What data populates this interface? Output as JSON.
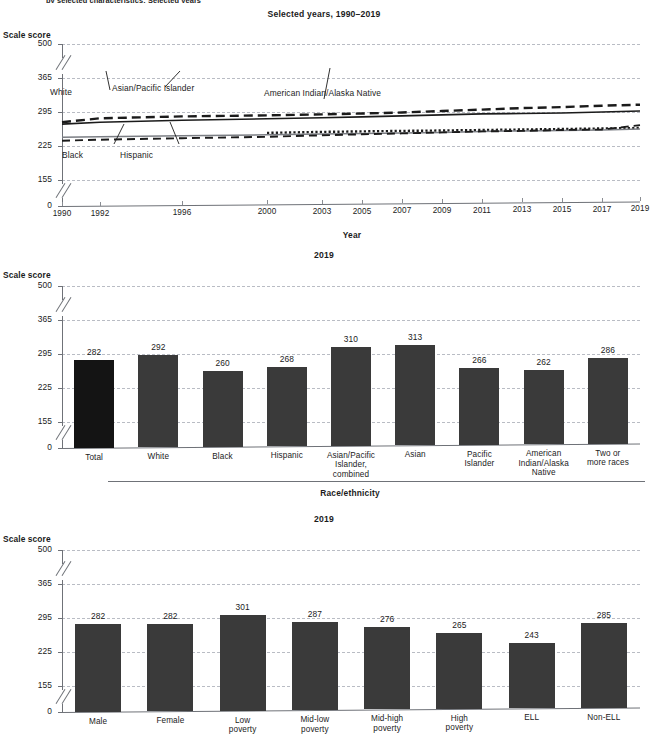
{
  "figure": {
    "clipped_heading": "by selected characteristics: Selected years",
    "y_axis_label": "Scale score"
  },
  "panel1": {
    "title": "Selected years, 1990–2019",
    "y_axis_label": "Scale score",
    "x_axis_label": "Year",
    "y_ticks": [
      "0",
      "155",
      "225",
      "295",
      "365",
      "500"
    ],
    "x_ticks": [
      "1990",
      "1992",
      "1996",
      "2000",
      "2003",
      "2005",
      "2007",
      "2009",
      "2011",
      "2013",
      "2015",
      "2017",
      "2019"
    ],
    "series_labels": [
      "White",
      "Asian/Pacific Islander",
      "American Indian/Alaska Native",
      "Black",
      "Hispanic"
    ]
  },
  "panel2": {
    "title": "2019",
    "y_axis_label": "Scale score",
    "x_axis_label": "Race/ethnicity",
    "y_ticks": [
      "0",
      "155",
      "225",
      "295",
      "365",
      "500"
    ]
  },
  "panel3": {
    "title": "2019",
    "y_axis_label": "Scale score",
    "y_ticks": [
      "0",
      "155",
      "225",
      "295",
      "365",
      "500"
    ]
  },
  "colors": {
    "bar_default": "#3a3a3a",
    "bar_total": "#141414",
    "gridline": "#b9bcc4",
    "axis": "#6f7278",
    "text": "#1b1b1b"
  },
  "chart_data": [
    {
      "type": "line",
      "title": "Selected years, 1990–2019",
      "xlabel": "Year",
      "ylabel": "Scale score",
      "ylim": [
        0,
        500
      ],
      "y_ticks": [
        0,
        155,
        225,
        295,
        365,
        500
      ],
      "y_axis_break": true,
      "grid": true,
      "legend": "inline-labels",
      "x": [
        1990,
        1992,
        1996,
        2000,
        2003,
        2005,
        2007,
        2009,
        2011,
        2013,
        2015,
        2017,
        2019
      ],
      "series": [
        {
          "name": "White",
          "style": "solid",
          "values": [
            270,
            274,
            278,
            281,
            283,
            285,
            287,
            289,
            291,
            292,
            293,
            295,
            297
          ]
        },
        {
          "name": "Asian/Pacific Islander",
          "style": "dashed",
          "values": [
            274,
            282,
            286,
            288,
            290,
            292,
            294,
            297,
            300,
            303,
            305,
            308,
            310
          ]
        },
        {
          "name": "American Indian/Alaska Native",
          "style": "dotted",
          "values": [
            null,
            null,
            null,
            252,
            254,
            255,
            256,
            257,
            258,
            259,
            260,
            261,
            262
          ]
        },
        {
          "name": "Black",
          "style": "solid-gray",
          "values": [
            243,
            244,
            246,
            248,
            250,
            251,
            252,
            253,
            255,
            256,
            257,
            258,
            260
          ]
        },
        {
          "name": "Hispanic",
          "style": "dashed-thin",
          "values": [
            236,
            238,
            241,
            244,
            247,
            249,
            251,
            253,
            255,
            256,
            258,
            259,
            268
          ]
        }
      ]
    },
    {
      "type": "bar",
      "title": "2019",
      "xlabel": "Race/ethnicity",
      "ylabel": "Scale score",
      "ylim": [
        0,
        500
      ],
      "y_ticks": [
        0,
        155,
        225,
        295,
        365,
        500
      ],
      "y_axis_break": true,
      "grid": true,
      "categories": [
        "Total",
        "White",
        "Black",
        "Hispanic",
        "Asian/Pacific Islander, combined",
        "Asian",
        "Pacific Islander",
        "American Indian/Alaska Native",
        "Two or more races"
      ],
      "values": [
        282,
        292,
        260,
        268,
        310,
        313,
        266,
        262,
        286
      ],
      "highlight_index": 0
    },
    {
      "type": "bar",
      "title": "2019",
      "xlabel": "",
      "ylabel": "Scale score",
      "ylim": [
        0,
        500
      ],
      "y_ticks": [
        0,
        155,
        225,
        295,
        365,
        500
      ],
      "y_axis_break": true,
      "grid": true,
      "categories": [
        "Male",
        "Female",
        "Low poverty",
        "Mid-low poverty",
        "Mid-high poverty",
        "High poverty",
        "ELL",
        "Non-ELL"
      ],
      "values": [
        282,
        282,
        301,
        287,
        276,
        265,
        243,
        285
      ]
    }
  ]
}
